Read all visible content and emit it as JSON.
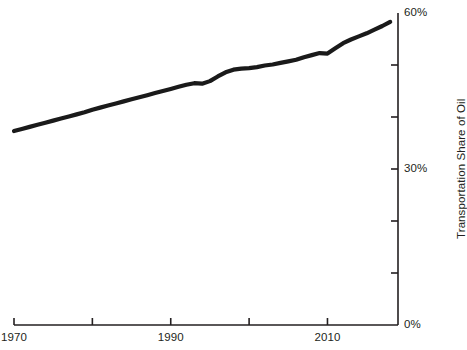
{
  "chart_data": {
    "type": "line",
    "title": "",
    "subtitle": "",
    "xlabel": "",
    "ylabel": "Transportation Share of Oil",
    "xlim": [
      1970,
      2019
    ],
    "ylim": [
      0,
      60
    ],
    "grid": false,
    "legend": null,
    "x_tick_labels": [
      "1970",
      "1990",
      "2010"
    ],
    "x_ticks": [
      1970,
      1980,
      1990,
      2000,
      2010
    ],
    "y_tick_labels": [
      "0%",
      "30%",
      "60%"
    ],
    "y_ticks": [
      0,
      10,
      20,
      30,
      40,
      50,
      60
    ],
    "y_unit": "%",
    "line_color": "#1a1a1a",
    "line_width": 4.2,
    "axis_color": "#231f20",
    "series": [
      {
        "name": "Transportation Share of Oil",
        "x": [
          1970,
          1971,
          1972,
          1973,
          1974,
          1975,
          1976,
          1977,
          1978,
          1979,
          1980,
          1981,
          1982,
          1983,
          1984,
          1985,
          1986,
          1987,
          1988,
          1989,
          1990,
          1991,
          1992,
          1993,
          1994,
          1995,
          1996,
          1997,
          1998,
          1999,
          2000,
          2001,
          2002,
          2003,
          2004,
          2005,
          2006,
          2007,
          2008,
          2009,
          2010,
          2011,
          2012,
          2013,
          2014,
          2015,
          2016,
          2017,
          2018
        ],
        "values": [
          37.3,
          37.7,
          38.1,
          38.5,
          38.9,
          39.3,
          39.7,
          40.1,
          40.5,
          40.9,
          41.4,
          41.8,
          42.2,
          42.6,
          43.0,
          43.4,
          43.8,
          44.2,
          44.6,
          45.0,
          45.4,
          45.8,
          46.2,
          46.5,
          46.4,
          46.9,
          47.8,
          48.6,
          49.1,
          49.3,
          49.4,
          49.6,
          49.9,
          50.1,
          50.4,
          50.7,
          51.0,
          51.5,
          51.9,
          52.3,
          52.2,
          53.2,
          54.2,
          54.9,
          55.5,
          56.1,
          56.8,
          57.5,
          58.3
        ]
      }
    ]
  },
  "axes": {
    "y_axis_title": "Transportation Share of Oil",
    "y_labels": [
      {
        "text": "60%",
        "value": 60
      },
      {
        "text": "30%",
        "value": 30
      },
      {
        "text": "0%",
        "value": 0
      }
    ],
    "x_labels": [
      {
        "text": "1970",
        "value": 1970
      },
      {
        "text": "1990",
        "value": 1990
      },
      {
        "text": "2010",
        "value": 2010
      }
    ]
  }
}
